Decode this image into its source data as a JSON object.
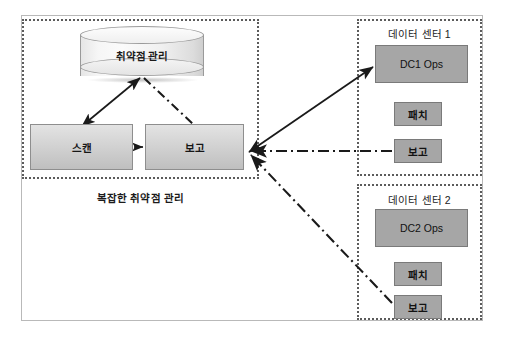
{
  "diagram": {
    "title_caption": "복잡한 취약점 관리",
    "datastore": {
      "label": "취약점 관리",
      "shape": "cylinder-database"
    },
    "process_boxes": [
      {
        "id": "scan",
        "label": "스캔"
      },
      {
        "id": "report",
        "label": "보고"
      }
    ],
    "groups": [
      {
        "id": "vulnerability-management",
        "label": "복잡한 취약점 관리",
        "border": "dotted"
      },
      {
        "id": "data-center-1",
        "label": "데이터 센터 1",
        "border": "dotted",
        "items": [
          {
            "id": "dc1-ops",
            "label": "DC1 Ops"
          },
          {
            "id": "dc1-patch",
            "label": "패치"
          },
          {
            "id": "dc1-report",
            "label": "보고"
          }
        ]
      },
      {
        "id": "data-center-2",
        "label": "데이터 센터 2",
        "border": "dotted",
        "items": [
          {
            "id": "dc2-ops",
            "label": "DC2 Ops"
          },
          {
            "id": "dc2-patch",
            "label": "패치"
          },
          {
            "id": "dc2-report",
            "label": "보고"
          }
        ]
      }
    ],
    "connectors": [
      {
        "id": "scan-to-db",
        "style": "solid",
        "arrow": "both"
      },
      {
        "id": "db-to-report",
        "style": "dash-dot",
        "arrow": "none"
      },
      {
        "id": "scan-to-report",
        "style": "solid",
        "arrow": "end"
      },
      {
        "id": "report-to-dc1ops",
        "style": "solid",
        "arrow": "both"
      },
      {
        "id": "dc1report-to-report",
        "style": "dash-dot",
        "arrow": "end"
      },
      {
        "id": "dc2report-to-report",
        "style": "dash-dot",
        "arrow": "end"
      }
    ],
    "colors": {
      "group_border": "#5b5b5b",
      "outer_frame": "#b9b9b9",
      "dc_box_fill": "#a6a6a6",
      "proc_box_fill": "#d3d3d3",
      "line": "#1a1a1a",
      "text": "#161616",
      "background": "#ffffff"
    }
  }
}
